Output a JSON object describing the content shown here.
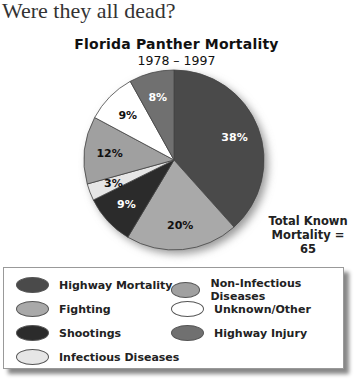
{
  "question": "Were they all dead?",
  "chart_data": {
    "type": "pie",
    "title": "Florida Panther Mortality",
    "subtitle": "1978 – 1997",
    "annotation": "Total Known Mortality = 65",
    "categories": [
      "Highway Mortality",
      "Fighting",
      "Shootings",
      "Infectious Diseases",
      "Non-Infectious Diseases",
      "Unknown/Other",
      "Highway Injury"
    ],
    "values": [
      38,
      20,
      9,
      3,
      12,
      9,
      8
    ],
    "labels": [
      "38%",
      "20%",
      "9%",
      "3%",
      "12%",
      "9%",
      "8%"
    ],
    "colors": [
      "#4a4a4a",
      "#a9a9a9",
      "#2b2b2b",
      "#e6e6e6",
      "#a0a0a0",
      "#ffffff",
      "#707070"
    ],
    "label_colors": [
      "#ffffff",
      "#111111",
      "#ffffff",
      "#111111",
      "#111111",
      "#111111",
      "#ffffff"
    ],
    "legend_position": "bottom"
  },
  "annotation": {
    "line1": "Total Known",
    "line2": "Mortality = 65"
  },
  "legend": [
    {
      "label": "Highway Mortality",
      "color": "#4a4a4a"
    },
    {
      "label": "Fighting",
      "color": "#a9a9a9"
    },
    {
      "label": "Shootings",
      "color": "#2b2b2b"
    },
    {
      "label": "Infectious Diseases",
      "color": "#e6e6e6"
    },
    {
      "label": "Non-Infectious Diseases",
      "color": "#a0a0a0"
    },
    {
      "label": "Unknown/Other",
      "color": "#ffffff"
    },
    {
      "label": "Highway Injury",
      "color": "#707070"
    }
  ]
}
